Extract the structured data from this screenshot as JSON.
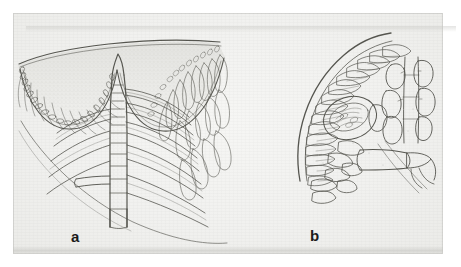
{
  "plate": {
    "kind": "scanned-scientific-illustration-plate",
    "medium": "pencil and ink line drawing",
    "background_color": "#f1f1ef",
    "ink_color": "#4a4a48",
    "page_color": "#ffffff",
    "label_color": "#1b1b1b",
    "panel_count": 2
  },
  "figures": [
    {
      "id": "a",
      "label": "a",
      "title": "",
      "description": "Cut-away view of a bell- or cup-shaped body with a deeply scalloped, two-lobed rim; a segmented central axis rises from the base through the centre of the cup, bearing regularly spaced paired lateral rib-like branches that sweep outward and downward; the inner right flank is lined with a dense palisade of elongate club-shaped cells.",
      "bounds": {
        "x": 14,
        "y": 18,
        "width": 222,
        "height": 215
      },
      "label_position": {
        "x": 71,
        "y": 229
      }
    },
    {
      "id": "b",
      "label": "b",
      "title": "",
      "description": "Detail of a sector of the same structure: a curved outer wall lined on its inner face with a dense row of elongate palisade cells; a stout jointed stalk runs from the lower right to an oval granular body set against the wall, with a branched terminal arm bearing several rounded to oblong inflated cells at upper right.",
      "bounds": {
        "x": 280,
        "y": 28,
        "width": 150,
        "height": 200
      },
      "label_position": {
        "x": 310,
        "y": 228
      }
    }
  ],
  "labels": {
    "a": "a",
    "b": "b"
  }
}
